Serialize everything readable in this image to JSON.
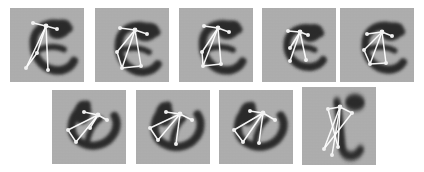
{
  "figure": {
    "type": "image-grid",
    "caption": "",
    "background_color": "#ffffff",
    "patch_background_color": "#adadad",
    "ink_color": "#2b2b2b",
    "skeleton_color": "#ffffff",
    "node_color": "#f2f2f2",
    "patch_count": 9,
    "rows": [
      {
        "row_index": 1,
        "tile_count": 5
      },
      {
        "row_index": 2,
        "tile_count": 4
      }
    ],
    "tiles": [
      {
        "id": "patch-1",
        "label": "patch 1",
        "row": 1,
        "col": 1,
        "x": 10,
        "y": 8,
        "w": 74,
        "h": 74,
        "glyph": "e",
        "glyph_transform": "rotate(-4) scale(1.0,1.08)",
        "glyph_cx": 40,
        "glyph_cy": 40,
        "glyph_size": 56,
        "hub": [
          36,
          18
        ],
        "nodes": [
          [
            23,
            15
          ],
          [
            47,
            21
          ],
          [
            27,
            45
          ],
          [
            16,
            60
          ],
          [
            38,
            62
          ]
        ],
        "edges": [
          [
            0,
            1
          ],
          [
            0,
            2
          ],
          [
            0,
            3
          ],
          [
            0,
            4
          ],
          [
            0,
            5
          ],
          [
            3,
            4
          ]
        ]
      },
      {
        "id": "patch-2",
        "label": "patch 2",
        "row": 1,
        "col": 2,
        "x": 95,
        "y": 8,
        "w": 74,
        "h": 74,
        "glyph": "e",
        "glyph_transform": "rotate(3) scale(1.02,1.05)",
        "glyph_cx": 40,
        "glyph_cy": 41,
        "glyph_size": 56,
        "hub": [
          40,
          22
        ],
        "nodes": [
          [
            25,
            20
          ],
          [
            52,
            26
          ],
          [
            22,
            44
          ],
          [
            27,
            60
          ],
          [
            46,
            58
          ]
        ],
        "edges": [
          [
            0,
            1
          ],
          [
            0,
            2
          ],
          [
            0,
            3
          ],
          [
            0,
            4
          ],
          [
            0,
            5
          ],
          [
            3,
            4
          ],
          [
            4,
            5
          ]
        ]
      },
      {
        "id": "patch-3",
        "label": "patch 3",
        "row": 1,
        "col": 3,
        "x": 179,
        "y": 8,
        "w": 74,
        "h": 74,
        "glyph": "e",
        "glyph_transform": "rotate(-2) scale(1.0,1.06)",
        "glyph_cx": 40,
        "glyph_cy": 40,
        "glyph_size": 56,
        "hub": [
          39,
          20
        ],
        "nodes": [
          [
            25,
            18
          ],
          [
            50,
            24
          ],
          [
            23,
            44
          ],
          [
            24,
            58
          ],
          [
            42,
            56
          ]
        ],
        "edges": [
          [
            0,
            1
          ],
          [
            0,
            2
          ],
          [
            0,
            3
          ],
          [
            0,
            4
          ],
          [
            0,
            5
          ],
          [
            3,
            4
          ],
          [
            4,
            5
          ]
        ]
      },
      {
        "id": "patch-4",
        "label": "patch 4",
        "row": 1,
        "col": 4,
        "x": 262,
        "y": 8,
        "w": 74,
        "h": 74,
        "glyph": "e",
        "glyph_transform": "rotate(0) scale(0.92,1.0)",
        "glyph_cx": 40,
        "glyph_cy": 40,
        "glyph_size": 50,
        "hub": [
          38,
          24
        ],
        "nodes": [
          [
            26,
            23
          ],
          [
            46,
            27
          ],
          [
            28,
            40
          ],
          [
            28,
            53
          ],
          [
            44,
            52
          ]
        ],
        "edges": [
          [
            0,
            1
          ],
          [
            0,
            2
          ],
          [
            0,
            3
          ],
          [
            0,
            4
          ],
          [
            0,
            5
          ],
          [
            3,
            4
          ]
        ]
      },
      {
        "id": "patch-5",
        "label": "patch 5",
        "row": 1,
        "col": 5,
        "x": 340,
        "y": 8,
        "w": 74,
        "h": 74,
        "glyph": "e",
        "glyph_transform": "rotate(2) scale(0.98,1.04)",
        "glyph_cx": 41,
        "glyph_cy": 40,
        "glyph_size": 54,
        "hub": [
          42,
          24
        ],
        "nodes": [
          [
            27,
            26
          ],
          [
            52,
            28
          ],
          [
            24,
            42
          ],
          [
            30,
            56
          ],
          [
            46,
            55
          ]
        ],
        "edges": [
          [
            0,
            1
          ],
          [
            0,
            2
          ],
          [
            0,
            3
          ],
          [
            0,
            4
          ],
          [
            0,
            5
          ],
          [
            3,
            4
          ],
          [
            4,
            5
          ]
        ]
      },
      {
        "id": "patch-6",
        "label": "patch 6",
        "row": 2,
        "col": 1,
        "x": 52,
        "y": 90,
        "w": 74,
        "h": 74,
        "glyph": "e",
        "glyph_transform": "rotate(-62) scale(1.0,1.02)",
        "glyph_cx": 40,
        "glyph_cy": 40,
        "glyph_size": 54,
        "hub": [
          46,
          25
        ],
        "nodes": [
          [
            32,
            22
          ],
          [
            55,
            30
          ],
          [
            16,
            40
          ],
          [
            24,
            52
          ],
          [
            38,
            38
          ]
        ],
        "edges": [
          [
            0,
            1
          ],
          [
            0,
            2
          ],
          [
            0,
            3
          ],
          [
            0,
            4
          ],
          [
            0,
            5
          ],
          [
            3,
            4
          ]
        ]
      },
      {
        "id": "patch-7",
        "label": "patch 7",
        "row": 2,
        "col": 2,
        "x": 136,
        "y": 90,
        "w": 74,
        "h": 74,
        "glyph": "e",
        "glyph_transform": "rotate(-68) scale(1.02,1.02)",
        "glyph_cx": 40,
        "glyph_cy": 41,
        "glyph_size": 56,
        "hub": [
          44,
          24
        ],
        "nodes": [
          [
            30,
            22
          ],
          [
            56,
            30
          ],
          [
            14,
            38
          ],
          [
            22,
            50
          ],
          [
            40,
            54
          ]
        ],
        "edges": [
          [
            0,
            1
          ],
          [
            0,
            2
          ],
          [
            0,
            3
          ],
          [
            0,
            4
          ],
          [
            0,
            5
          ],
          [
            3,
            4
          ]
        ]
      },
      {
        "id": "patch-8",
        "label": "patch 8",
        "row": 2,
        "col": 3,
        "x": 219,
        "y": 90,
        "w": 74,
        "h": 74,
        "glyph": "e",
        "glyph_transform": "rotate(-66) scale(1.0,1.03)",
        "glyph_cx": 40,
        "glyph_cy": 41,
        "glyph_size": 55,
        "hub": [
          44,
          23
        ],
        "nodes": [
          [
            31,
            21
          ],
          [
            56,
            30
          ],
          [
            15,
            40
          ],
          [
            24,
            52
          ],
          [
            40,
            53
          ]
        ],
        "edges": [
          [
            0,
            1
          ],
          [
            0,
            2
          ],
          [
            0,
            3
          ],
          [
            0,
            4
          ],
          [
            0,
            5
          ],
          [
            3,
            4
          ]
        ]
      },
      {
        "id": "patch-9",
        "label": "patch 9",
        "row": 2,
        "col": 4,
        "x": 302,
        "y": 87,
        "w": 74,
        "h": 78,
        "glyph": "L",
        "glyph_transform": "rotate(2) scale(1.0,1.2)",
        "glyph_cx": 40,
        "glyph_cy": 42,
        "glyph_size": 56,
        "hub": [
          38,
          20
        ],
        "nodes": [
          [
            26,
            22
          ],
          [
            50,
            26
          ],
          [
            22,
            62
          ],
          [
            36,
            60
          ],
          [
            30,
            68
          ]
        ],
        "edges": [
          [
            0,
            1
          ],
          [
            0,
            2
          ],
          [
            0,
            3
          ],
          [
            0,
            4
          ],
          [
            0,
            5
          ],
          [
            1,
            4
          ],
          [
            2,
            3
          ]
        ]
      }
    ]
  }
}
